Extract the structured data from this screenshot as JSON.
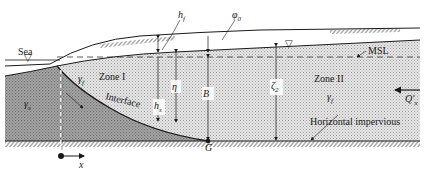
{
  "diagram": {
    "type": "coastal aquifer cross-section (sea water intrusion, sharp interface)",
    "labels": {
      "sea": "Sea",
      "h_f": "h",
      "h_f_sub": "f",
      "phi_0": "φ",
      "phi_0_sub": "0",
      "msl": "MSL",
      "zone1": "Zone I",
      "zone2": "Zone II",
      "gamma_f_left": "γ",
      "gamma_f_left_sub": "f",
      "gamma_s": "γ",
      "gamma_s_sub": "s",
      "h_s": "h",
      "h_s_sub": "s",
      "eta": "η",
      "B": "B",
      "zeta2": "ζ",
      "zeta2_sub": "2",
      "gamma_f_right": "γ",
      "gamma_f_right_sub": "f",
      "q_x": "Q′",
      "q_x_sub": "x",
      "interface": "Interface",
      "horizontal_impervious": "Horizontal impervious",
      "toe_point": "G",
      "x_axis": "x"
    },
    "colors": {
      "freshwater_fill": "#d9d9d9",
      "saltwater_fill": "#9a9a9a",
      "line": "#1a1a1a",
      "background": "#ffffff"
    }
  }
}
